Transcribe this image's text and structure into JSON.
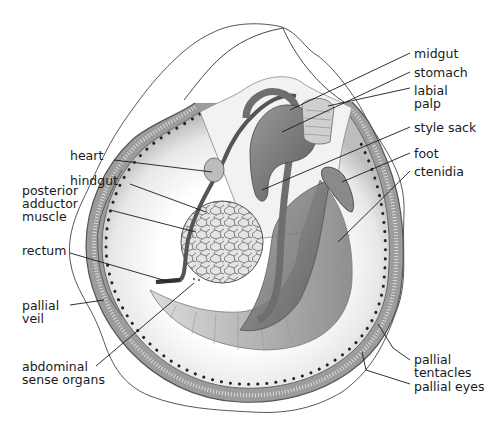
{
  "diagram": {
    "labels_left": [
      {
        "id": "heart",
        "text": "heart",
        "x": 70,
        "y": 155
      },
      {
        "id": "hindgut",
        "text": "hindgut",
        "x": 70,
        "y": 180
      },
      {
        "id": "posterior-adductor-muscle",
        "text": "posterior\nadductor\nmuscle",
        "x": 22,
        "y": 182
      },
      {
        "id": "rectum",
        "text": "rectum",
        "x": 22,
        "y": 246
      },
      {
        "id": "pallial-veil",
        "text": "pallial\nveil",
        "x": 22,
        "y": 299
      },
      {
        "id": "abdominal-sense-organs",
        "text": "abdominal\nsense organs",
        "x": 22,
        "y": 359
      }
    ],
    "labels_right": [
      {
        "id": "midgut",
        "text": "midgut",
        "x": 414,
        "y": 47
      },
      {
        "id": "stomach",
        "text": "stomach",
        "x": 414,
        "y": 66
      },
      {
        "id": "labial-palp",
        "text": "labial\npalp",
        "x": 414,
        "y": 84
      },
      {
        "id": "style-sack",
        "text": "style sack",
        "x": 414,
        "y": 121
      },
      {
        "id": "foot",
        "text": "foot",
        "x": 414,
        "y": 147
      },
      {
        "id": "ctenidia",
        "text": "ctenidia",
        "x": 414,
        "y": 165
      },
      {
        "id": "pallial-tentacles",
        "text": "pallial\ntentacles",
        "x": 414,
        "y": 353
      },
      {
        "id": "pallial-eyes",
        "text": "pallial eyes",
        "x": 414,
        "y": 380
      }
    ],
    "colors": {
      "line": "#1a1a1a",
      "mantle": "#8a8a8a",
      "organ_dark": "#6e6e6e",
      "organ_mid": "#a0a0a0",
      "organ_light": "#d6d6d6",
      "background": "#ffffff"
    }
  }
}
